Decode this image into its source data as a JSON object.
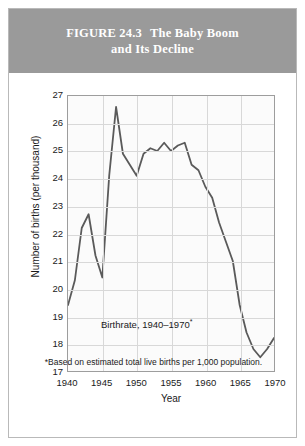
{
  "figure": {
    "label": "FIGURE 24.3",
    "title_line1": "The Baby Boom",
    "title_line2": "and Its Decline",
    "footnote": "*Based on estimated total live births per 1,000 population.",
    "band_color": "#9a9a9a",
    "line_color": "#5a5a5a",
    "grid_color": "#d8d8d8",
    "frame_color": "#9d9d9d"
  },
  "chart_data": {
    "type": "line",
    "xlabel": "Year",
    "ylabel": "Number of births (per thousand)",
    "xlim": [
      1940,
      1970
    ],
    "ylim": [
      17,
      27
    ],
    "xticks": [
      1940,
      1945,
      1950,
      1955,
      1960,
      1965,
      1970
    ],
    "yticks": [
      17,
      18,
      19,
      20,
      21,
      22,
      23,
      24,
      25,
      26,
      27
    ],
    "grid": true,
    "legend": "none",
    "annotations": [
      {
        "text": "Birthrate, 1940–1970",
        "superscript": "*",
        "x": 1951.5,
        "y": 18.75
      }
    ],
    "series": [
      {
        "name": "Birthrate, 1940–1970",
        "x": [
          1940,
          1941,
          1942,
          1943,
          1944,
          1945,
          1946,
          1947,
          1948,
          1949,
          1950,
          1951,
          1952,
          1953,
          1954,
          1955,
          1956,
          1957,
          1958,
          1959,
          1960,
          1961,
          1962,
          1963,
          1964,
          1965,
          1966,
          1967,
          1968,
          1969,
          1970
        ],
        "values": [
          19.4,
          20.3,
          22.2,
          22.7,
          21.2,
          20.4,
          24.1,
          26.6,
          24.9,
          24.5,
          24.1,
          24.9,
          25.1,
          25.0,
          25.3,
          25.0,
          25.2,
          25.3,
          24.5,
          24.3,
          23.7,
          23.3,
          22.4,
          21.7,
          21.0,
          19.4,
          18.4,
          17.8,
          17.5,
          17.8,
          18.2
        ]
      }
    ]
  },
  "ticks": {
    "y": [
      "27",
      "26",
      "25",
      "24",
      "23",
      "22",
      "21",
      "20",
      "19",
      "18",
      "17"
    ],
    "x": [
      "1940",
      "1945",
      "1950",
      "1955",
      "1960",
      "1965",
      "1970"
    ]
  },
  "axis": {
    "x_title": "Year",
    "y_title": "Number of births (per thousand)"
  },
  "annotation": {
    "text": "Birthrate, 1940–1970",
    "marker": "*"
  }
}
